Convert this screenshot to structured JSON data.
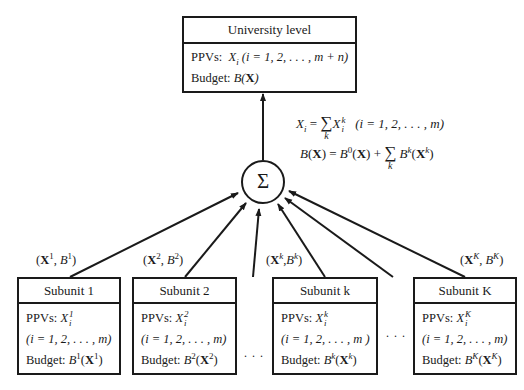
{
  "top_box": {
    "title": "University level",
    "ppvs_label": "PPVs:",
    "ppvs_var": "X",
    "ppvs_sub": "i",
    "ppvs_range": "(i = 1, 2, . . . , m + n)",
    "budget_label": "Budget:",
    "budget_expr": "B(X)"
  },
  "aggregator": {
    "symbol": "Σ",
    "eq1_lhs": "X",
    "eq1_lhs_sub": "i",
    "eq1_eq": "=",
    "eq1_sum_index": "k",
    "eq1_rhs": "X",
    "eq1_rhs_sup": "k",
    "eq1_rhs_sub": "i",
    "eq1_range": "(i = 1, 2, . . . , m)",
    "eq2_lhs": "B(X) = B",
    "eq2_sup0": "0",
    "eq2_mid": "(X) +",
    "eq2_sum_index": "k",
    "eq2_rhs": "B",
    "eq2_rhs_sup": "k",
    "eq2_rhs_arg": "(X",
    "eq2_rhs_arg_sup": "k",
    "eq2_close": ")"
  },
  "flows": [
    {
      "label_X": "X",
      "sup": "1",
      "label_B": "B"
    },
    {
      "label_X": "X",
      "sup": "2",
      "label_B": "B"
    },
    {
      "label_X": "X",
      "sup": "k",
      "label_B": "B"
    },
    {
      "label_X": "X",
      "sup": "K",
      "label_B": "B"
    }
  ],
  "subunits": [
    {
      "title": "Subunit 1",
      "ppvs_label": "PPVs:",
      "var": "X",
      "sup": "1",
      "sub": "i",
      "range": "(i = 1, 2, . . . , m)",
      "budget_label": "Budget:",
      "budget_B": "B",
      "budget_sup": "1",
      "budget_X_sup": "1"
    },
    {
      "title": "Subunit 2",
      "ppvs_label": "PPVs:",
      "var": "X",
      "sup": "2",
      "sub": "i",
      "range": "(i = 1, 2, . . . , m)",
      "budget_label": "Budget:",
      "budget_B": "B",
      "budget_sup": "2",
      "budget_X_sup": "2"
    },
    {
      "title": "Subunit k",
      "ppvs_label": "PPVs:",
      "var": "X",
      "sup": "k",
      "sub": "i",
      "range": "(i = 1, 2, . . . , m )",
      "budget_label": "Budget:",
      "budget_B": "B",
      "budget_sup": "k",
      "budget_X_sup": "k"
    },
    {
      "title": "Subunit K",
      "ppvs_label": "PPVs:",
      "var": "X",
      "sup": "K",
      "sub": "i",
      "range": "(i = 1, 2, . . . , m)",
      "budget_label": "Budget:",
      "budget_B": "B",
      "budget_sup": "K",
      "budget_X_sup": "K"
    }
  ],
  "ellipsis": ". . ."
}
